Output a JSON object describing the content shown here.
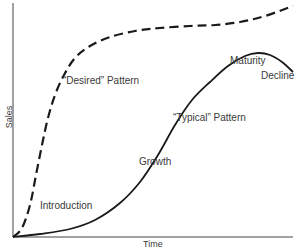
{
  "chart_data": {
    "type": "line",
    "title": "",
    "xlabel": "Time",
    "ylabel": "Sales",
    "grid": false,
    "axis_ticks": "none",
    "series": [
      {
        "name": "\"Desired\" Pattern",
        "style": "dashed",
        "color": "#1a1a1a",
        "points_px": [
          [
            13,
            237
          ],
          [
            22,
            228
          ],
          [
            30,
            205
          ],
          [
            36,
            175
          ],
          [
            42,
            145
          ],
          [
            48,
            118
          ],
          [
            55,
            95
          ],
          [
            64,
            75
          ],
          [
            75,
            58
          ],
          [
            90,
            46
          ],
          [
            110,
            37
          ],
          [
            135,
            31
          ],
          [
            160,
            28
          ],
          [
            190,
            26
          ],
          [
            215,
            25
          ],
          [
            240,
            22
          ],
          [
            265,
            16
          ],
          [
            293,
            6
          ]
        ]
      },
      {
        "name": "\"Typical\" Pattern",
        "style": "solid",
        "color": "#1a1a1a",
        "points_px": [
          [
            13,
            237
          ],
          [
            40,
            234
          ],
          [
            70,
            229
          ],
          [
            95,
            220
          ],
          [
            120,
            203
          ],
          [
            140,
            182
          ],
          [
            158,
            155
          ],
          [
            175,
            125
          ],
          [
            192,
            100
          ],
          [
            210,
            82
          ],
          [
            228,
            66
          ],
          [
            245,
            56
          ],
          [
            258,
            53
          ],
          [
            270,
            55
          ],
          [
            282,
            62
          ],
          [
            293,
            72
          ]
        ]
      }
    ],
    "annotations": [
      {
        "text": "\"Desired\" Pattern",
        "x": 64,
        "y": 80
      },
      {
        "text": "\"Typical\" Pattern",
        "x": 174,
        "y": 117
      },
      {
        "text": "Introduction",
        "x": 40,
        "y": 205
      },
      {
        "text": "Growth",
        "x": 145,
        "y": 162
      },
      {
        "text": "Maturity",
        "x": 230,
        "y": 60
      },
      {
        "text": "Decline",
        "x": 262,
        "y": 75
      }
    ]
  },
  "labels": {
    "desired": "“Desired” Pattern",
    "typical": "“Typical” Pattern",
    "introduction": "Introduction",
    "growth": "Growth",
    "maturity": "Maturity",
    "decline": "Decline",
    "xlabel": "Time",
    "ylabel": "Sales"
  }
}
